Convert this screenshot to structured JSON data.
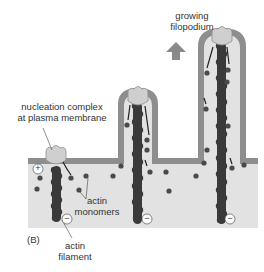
{
  "figure": {
    "panel_label": "(B)",
    "labels": {
      "growing_filopodium_line1": "growing",
      "growing_filopodium_line2": "filopodium",
      "nucleation_line1": "nucleation complex",
      "nucleation_line2": "at plasma membrane",
      "actin_monomers_line1": "actin",
      "actin_monomers_line2": "monomers",
      "actin_filament_line1": "actin",
      "actin_filament_line2": "filament",
      "plus_sign": "+",
      "minus_sign": "−"
    },
    "colors": {
      "membrane": "#8e8e8e",
      "cytoplasm": "#e2e2e2",
      "filament": "#3a3a3a",
      "monomer": "#4a4a4a",
      "nucleation_complex": "#cfcfcf",
      "arrow": "#8a8a8a",
      "text": "#333333"
    }
  }
}
